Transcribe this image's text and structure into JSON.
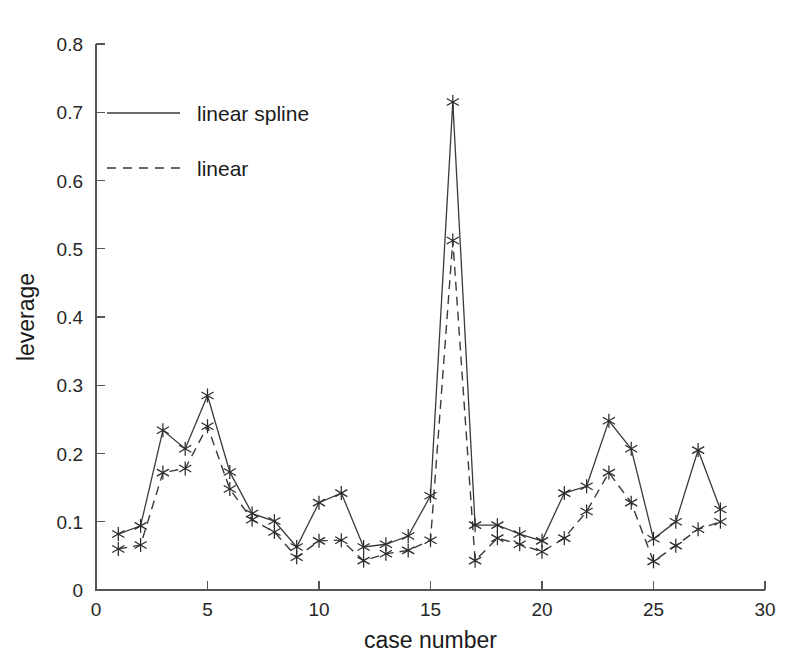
{
  "figure": {
    "background_color": "#ffffff",
    "line_color": "#3a3a3a",
    "axis_color": "#555555",
    "text_color": "#1a1a1a"
  },
  "chart_data": {
    "type": "line",
    "title": "",
    "xlabel": "case number",
    "ylabel": "leverage",
    "xlim": [
      0,
      30
    ],
    "ylim": [
      0,
      0.8
    ],
    "xticks": [
      0,
      5,
      10,
      15,
      20,
      25,
      30
    ],
    "xtick_labels": [
      "0",
      "5",
      "10",
      "15",
      "20",
      "25",
      "30"
    ],
    "yticks": [
      0,
      0.1,
      0.2,
      0.3,
      0.4,
      0.5,
      0.6,
      0.7,
      0.8
    ],
    "ytick_labels": [
      "0",
      "0.1",
      "0.2",
      "0.3",
      "0.4",
      "0.5",
      "0.6",
      "0.7",
      "0.8"
    ],
    "grid": false,
    "legend_position": "upper left",
    "marker": "asterisk",
    "x": [
      1,
      2,
      3,
      4,
      5,
      6,
      7,
      8,
      9,
      10,
      11,
      12,
      13,
      14,
      15,
      16,
      17,
      18,
      19,
      20,
      21,
      22,
      23,
      24,
      25,
      26,
      27,
      28
    ],
    "series": [
      {
        "name": "linear spline",
        "linestyle": "solid",
        "values": [
          0.082,
          0.094,
          0.234,
          0.207,
          0.285,
          0.173,
          0.112,
          0.101,
          0.063,
          0.128,
          0.142,
          0.063,
          0.067,
          0.079,
          0.138,
          0.715,
          0.095,
          0.095,
          0.082,
          0.072,
          0.142,
          0.152,
          0.248,
          0.207,
          0.075,
          0.1,
          0.205,
          0.118
        ]
      },
      {
        "name": "linear",
        "linestyle": "dashed",
        "values": [
          0.06,
          0.066,
          0.172,
          0.178,
          0.24,
          0.148,
          0.103,
          0.085,
          0.048,
          0.072,
          0.073,
          0.043,
          0.053,
          0.058,
          0.073,
          0.512,
          0.043,
          0.076,
          0.067,
          0.056,
          0.076,
          0.115,
          0.172,
          0.128,
          0.042,
          0.065,
          0.089,
          0.1
        ]
      }
    ],
    "legend": [
      {
        "label": "linear spline",
        "linestyle": "solid"
      },
      {
        "label": "linear",
        "linestyle": "dashed"
      }
    ]
  }
}
